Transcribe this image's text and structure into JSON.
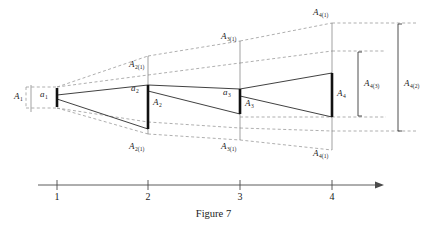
{
  "figure": {
    "caption": "Figure 7",
    "axis": {
      "ticks": [
        "1",
        "2",
        "3",
        "4"
      ],
      "arrow": "right-arrow"
    },
    "labels": {
      "A1": {
        "base": "A",
        "sub": "1"
      },
      "a1": {
        "base": "a",
        "sub": "1"
      },
      "A2_top": {
        "base": "A",
        "sub": "2(1)"
      },
      "a2": {
        "base": "a",
        "sub": "2"
      },
      "A2": {
        "base": "A",
        "sub": "2"
      },
      "A2_bot": {
        "base": "A",
        "sub": "2(1)"
      },
      "A3_top": {
        "base": "A",
        "sub": "3(1)"
      },
      "a3": {
        "base": "a",
        "sub": "3"
      },
      "A3": {
        "base": "A",
        "sub": "3"
      },
      "A3_bot": {
        "base": "A",
        "sub": "3(1)"
      },
      "A4_top": {
        "base": "A",
        "sub": "4(1)"
      },
      "A4": {
        "base": "A",
        "sub": "4"
      },
      "A4_bot": {
        "base": "A",
        "sub": "4(1)"
      },
      "A4_3": {
        "base": "A",
        "sub": "4(3)"
      },
      "A4_2": {
        "base": "A",
        "sub": "4(2)"
      }
    },
    "colors": {
      "stroke": "#2b2b2b",
      "dashed": "#8d8d8d",
      "axis": "#4a4a4a",
      "background": "#ffffff"
    },
    "geometry": {
      "stations_x": [
        57,
        148,
        240,
        332
      ],
      "axis_y": 185,
      "bars": [
        {
          "x": 57,
          "top": 88,
          "bottom": 107
        },
        {
          "x": 148,
          "top": 85,
          "bottom": 129
        },
        {
          "x": 240,
          "top": 89,
          "bottom": 114
        },
        {
          "x": 332,
          "top": 73,
          "bottom": 117
        }
      ]
    }
  }
}
